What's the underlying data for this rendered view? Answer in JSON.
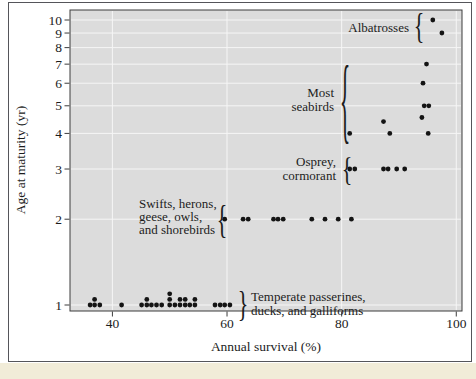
{
  "figure": {
    "colors": {
      "plot_bg": "#dcdcdc",
      "gridline": "#f6f6f6",
      "frame": "#3d3d3d",
      "outer_border": "#55555a",
      "dot": "#141414",
      "text": "#1c1c1c",
      "caption_strip": "#f1ecd8"
    }
  },
  "chart_data": {
    "type": "scatter",
    "xlabel": "Annual survival (%)",
    "ylabel": "Age at maturity (yr)",
    "x_scale": "linear",
    "y_scale": "log",
    "xlim": [
      32.6,
      101
    ],
    "ylim": [
      0.95,
      10.85
    ],
    "x_ticks": [
      40,
      60,
      80,
      100
    ],
    "y_ticks": [
      1,
      2,
      3,
      4,
      5,
      6,
      7,
      8,
      9,
      10
    ],
    "grid": true,
    "points_format": [
      "annual_survival_pct",
      "age_at_maturity_yr",
      "stack_level"
    ],
    "points": [
      [
        36.1,
        1,
        0
      ],
      [
        36.9,
        1,
        0
      ],
      [
        36.9,
        1,
        1
      ],
      [
        37.8,
        1,
        0
      ],
      [
        41.6,
        1,
        0
      ],
      [
        45.1,
        1,
        0
      ],
      [
        46.0,
        1,
        0
      ],
      [
        46.0,
        1,
        1
      ],
      [
        46.8,
        1,
        0
      ],
      [
        47.7,
        1,
        0
      ],
      [
        48.6,
        1,
        0
      ],
      [
        50.0,
        1,
        0
      ],
      [
        50.0,
        1,
        1
      ],
      [
        50.0,
        1,
        2
      ],
      [
        50.9,
        1,
        0
      ],
      [
        51.8,
        1,
        0
      ],
      [
        51.8,
        1,
        1
      ],
      [
        52.7,
        1,
        0
      ],
      [
        52.7,
        1,
        1
      ],
      [
        53.5,
        1,
        0
      ],
      [
        54.4,
        1,
        0
      ],
      [
        54.4,
        1,
        1
      ],
      [
        57.9,
        1,
        0
      ],
      [
        58.8,
        1,
        0
      ],
      [
        59.6,
        1,
        0
      ],
      [
        60.5,
        1,
        0
      ],
      [
        59.6,
        2,
        0
      ],
      [
        62.8,
        2,
        0
      ],
      [
        63.7,
        2,
        0
      ],
      [
        68.1,
        2,
        0
      ],
      [
        68.9,
        2,
        0
      ],
      [
        69.8,
        2,
        0
      ],
      [
        74.8,
        2,
        0
      ],
      [
        77.1,
        2,
        0
      ],
      [
        79.4,
        2,
        0
      ],
      [
        81.7,
        2,
        0
      ],
      [
        81.4,
        3,
        0
      ],
      [
        82.3,
        3,
        0
      ],
      [
        87.3,
        3,
        0
      ],
      [
        88.1,
        3,
        0
      ],
      [
        89.6,
        3,
        0
      ],
      [
        91.0,
        3,
        0
      ],
      [
        81.4,
        4,
        0
      ],
      [
        88.4,
        4,
        0
      ],
      [
        95.1,
        4,
        0
      ],
      [
        87.3,
        4.4,
        0
      ],
      [
        94.0,
        4.55,
        0
      ],
      [
        94.4,
        5,
        0
      ],
      [
        95.2,
        5,
        0
      ],
      [
        94.2,
        6,
        0
      ],
      [
        94.8,
        7,
        0
      ],
      [
        97.5,
        9,
        0
      ],
      [
        95.9,
        10,
        0
      ]
    ],
    "annotations": [
      {
        "id": "albatrosses",
        "lines": [
          "Albatrosses"
        ],
        "align": "end",
        "text_x": 409,
        "text_y": [
          27
        ],
        "brace": {
          "glyph": "{",
          "x": 419,
          "ym": 26,
          "h": 34
        }
      },
      {
        "id": "most-seabirds",
        "lines": [
          "Most",
          "seabirds"
        ],
        "align": "end",
        "text_x": 334,
        "text_y": [
          92,
          106
        ],
        "brace": {
          "glyph": "{",
          "x": 345,
          "ym": 99,
          "h": 88
        }
      },
      {
        "id": "osprey-cormorant",
        "lines": [
          "Osprey,",
          "cormorant"
        ],
        "align": "end",
        "text_x": 336,
        "text_y": [
          161,
          175
        ],
        "brace": {
          "glyph": "{",
          "x": 347,
          "ym": 168,
          "h": 32
        }
      },
      {
        "id": "swifts-herons-geese-owls-shorebirds",
        "lines": [
          "Swifts, herons,",
          "geese, owls,",
          "and shorebirds"
        ],
        "align": "start",
        "text_x": 139,
        "text_y": [
          203,
          216,
          229
        ],
        "brace": {
          "glyph": "{",
          "x": 222,
          "ym": 219,
          "h": 38
        }
      },
      {
        "id": "temperate-passerines-ducks-galliforms",
        "lines": [
          "Temperate passerines,",
          "ducks, and galliforms"
        ],
        "align": "start",
        "text_x": 251,
        "text_y": [
          296,
          310
        ],
        "brace": {
          "glyph": "}",
          "x": 243,
          "ym": 304,
          "h": 34
        }
      }
    ]
  }
}
